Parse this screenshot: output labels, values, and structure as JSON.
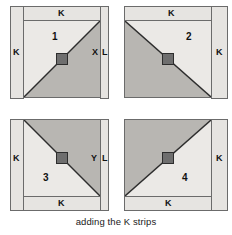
{
  "figure": {
    "caption": "adding the K strips",
    "colors": {
      "background": "#ffffff",
      "light_fabric": "#ebe9e6",
      "shaded_fabric": "#b8b6b2",
      "strip_fill": "#e6e4e1",
      "outline": "#6b6b6b",
      "centre_marker": "#6e6e6e",
      "text": "#111111"
    },
    "blocks": [
      {
        "id": "block-1",
        "number": "1",
        "diagonal": "bottom-left-to-top-right",
        "shaded_half": "below-right",
        "strips": [
          {
            "name": "top",
            "label": "K"
          },
          {
            "name": "left",
            "label": "K"
          }
        ],
        "edge_labels": [
          {
            "name": "x-label",
            "text": "X"
          },
          {
            "name": "l-label",
            "text": "L"
          }
        ]
      },
      {
        "id": "block-2",
        "number": "2",
        "diagonal": "top-left-to-bottom-right",
        "shaded_half": "below-left",
        "strips": [
          {
            "name": "top",
            "label": "K"
          },
          {
            "name": "right",
            "label": "K"
          }
        ],
        "edge_labels": []
      },
      {
        "id": "block-3",
        "number": "3",
        "diagonal": "top-left-to-bottom-right",
        "shaded_half": "above-right",
        "strips": [
          {
            "name": "left",
            "label": "K"
          },
          {
            "name": "bottom",
            "label": "K"
          }
        ],
        "edge_labels": [
          {
            "name": "y-label",
            "text": "Y"
          },
          {
            "name": "l-label",
            "text": "L"
          }
        ]
      },
      {
        "id": "block-4",
        "number": "4",
        "diagonal": "bottom-left-to-top-right",
        "shaded_half": "above-left",
        "strips": [
          {
            "name": "right",
            "label": "K"
          },
          {
            "name": "bottom",
            "label": "K"
          }
        ],
        "edge_labels": []
      }
    ]
  }
}
